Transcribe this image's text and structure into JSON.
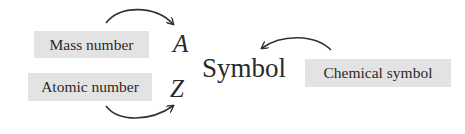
{
  "diagram": {
    "labels": {
      "mass_number": "Mass number",
      "atomic_number": "Atomic number",
      "chemical_symbol": "Chemical symbol"
    },
    "notation": {
      "mass_symbol": "A",
      "atomic_symbol": "Z",
      "element_symbol": "Symbol"
    },
    "arrows": [
      {
        "from": "Mass number",
        "to": "A"
      },
      {
        "from": "Atomic number",
        "to": "Z"
      },
      {
        "from": "Chemical symbol",
        "to": "Symbol"
      }
    ],
    "colors": {
      "box_fill": "#e3e3e3",
      "text": "#2a2a2a",
      "arrow": "#333333"
    }
  }
}
